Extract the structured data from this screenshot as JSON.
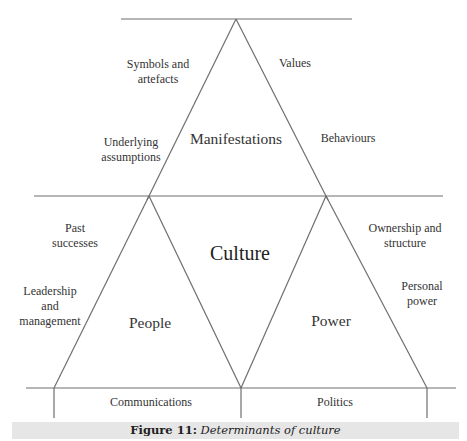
{
  "figure": {
    "caption": {
      "label": "Figure 11:",
      "title": "Determinants of culture"
    },
    "center_label": "Culture",
    "triangles": {
      "top": {
        "label": "Manifestations"
      },
      "left": {
        "label": "People"
      },
      "right": {
        "label": "Power"
      }
    },
    "factors": {
      "symbols_and_artefacts": "Symbols and\nartefacts",
      "values": "Values",
      "underlying_assumptions": "Underlying\nassumptions",
      "behaviours": "Behaviours",
      "past_successes": "Past\nsuccesses",
      "leadership_and_management": "Leadership\nand\nmanagement",
      "ownership_and_structure": "Ownership and\nstructure",
      "personal_power": "Personal\npower",
      "communications": "Communications",
      "politics": "Politics"
    },
    "colors": {
      "line": "#6e6e6e",
      "text": "#333333",
      "caption_bg": "#e6e6e6"
    }
  }
}
